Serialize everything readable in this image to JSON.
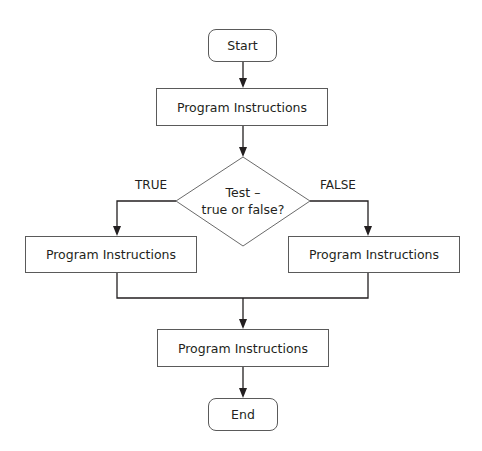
{
  "diagram": {
    "type": "flowchart",
    "nodes": {
      "start": {
        "label": "Start",
        "shape": "terminal"
      },
      "process_1": {
        "label": "Program Instructions",
        "shape": "process"
      },
      "decision": {
        "line1": "Test –",
        "line2": "true or false?",
        "shape": "decision"
      },
      "process_true": {
        "label": "Program Instructions",
        "shape": "process"
      },
      "process_false": {
        "label": "Program Instructions",
        "shape": "process"
      },
      "process_merge": {
        "label": "Program Instructions",
        "shape": "process"
      },
      "end": {
        "label": "End",
        "shape": "terminal"
      }
    },
    "branch_labels": {
      "true": "TRUE",
      "false": "FALSE"
    },
    "edges": [
      {
        "from": "start",
        "to": "process_1"
      },
      {
        "from": "process_1",
        "to": "decision"
      },
      {
        "from": "decision",
        "to": "process_true",
        "label": "TRUE"
      },
      {
        "from": "decision",
        "to": "process_false",
        "label": "FALSE"
      },
      {
        "from": "process_true",
        "to": "process_merge"
      },
      {
        "from": "process_false",
        "to": "process_merge"
      },
      {
        "from": "process_merge",
        "to": "end"
      }
    ],
    "colors": {
      "line": "#231f20",
      "box_border": "#5a5a5a",
      "text": "#231f20"
    }
  }
}
